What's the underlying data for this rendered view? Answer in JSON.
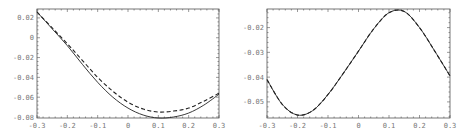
{
  "chart_data": [
    {
      "type": "line",
      "title": "",
      "xlabel": "",
      "ylabel": "",
      "xlim": [
        -0.3,
        0.3
      ],
      "ylim": [
        -0.081,
        0.029
      ],
      "grid": false,
      "legend": null,
      "xticks": [
        "-0.3",
        "-0.2",
        "-0.1",
        "0",
        "0.1",
        "0.2",
        "0.3"
      ],
      "yticks": [
        "0.02",
        "0",
        "-0.02",
        "-0.04",
        "-0.06",
        "-0.08"
      ],
      "x": [
        -0.3,
        -0.25,
        -0.2,
        -0.15,
        -0.1,
        -0.05,
        0,
        0.05,
        0.1,
        0.15,
        0.2,
        0.25,
        0.3
      ],
      "series": [
        {
          "name": "solid",
          "style": "solid",
          "values": [
            0.026,
            0.009,
            -0.008,
            -0.027,
            -0.045,
            -0.06,
            -0.071,
            -0.078,
            -0.081,
            -0.08,
            -0.076,
            -0.068,
            -0.057
          ]
        },
        {
          "name": "dashed",
          "style": "dashed",
          "values": [
            0.026,
            0.01,
            -0.006,
            -0.023,
            -0.04,
            -0.054,
            -0.065,
            -0.072,
            -0.075,
            -0.074,
            -0.071,
            -0.064,
            -0.056
          ]
        }
      ]
    },
    {
      "type": "line",
      "title": "",
      "xlabel": "",
      "ylabel": "",
      "xlim": [
        -0.3,
        0.3
      ],
      "ylim": [
        -0.0565,
        -0.0125
      ],
      "grid": false,
      "legend": null,
      "xticks": [
        "-0.3",
        "-0.2",
        "-0.1",
        "0",
        "0.1",
        "0.2",
        "0.3"
      ],
      "yticks": [
        "-0.02",
        "-0.03",
        "-0.04",
        "-0.05"
      ],
      "x": [
        -0.3,
        -0.25,
        -0.2,
        -0.15,
        -0.1,
        -0.05,
        0,
        0.05,
        0.1,
        0.15,
        0.2,
        0.25,
        0.3
      ],
      "series": [
        {
          "name": "solid",
          "style": "solid",
          "values": [
            -0.041,
            -0.051,
            -0.0553,
            -0.0535,
            -0.047,
            -0.0385,
            -0.0295,
            -0.0205,
            -0.014,
            -0.0135,
            -0.02,
            -0.0295,
            -0.0395
          ]
        },
        {
          "name": "dashed",
          "style": "dashed",
          "values": [
            -0.041,
            -0.051,
            -0.0553,
            -0.0535,
            -0.047,
            -0.0385,
            -0.0295,
            -0.0205,
            -0.014,
            -0.0135,
            -0.02,
            -0.0295,
            -0.0395
          ]
        }
      ]
    }
  ]
}
